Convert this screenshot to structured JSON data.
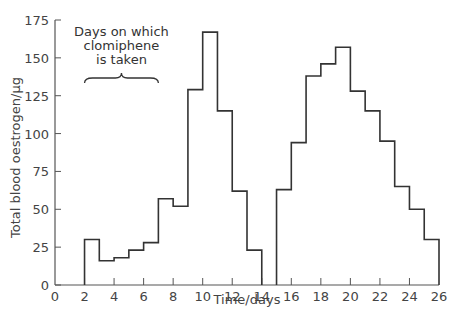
{
  "chart_data": {
    "type": "line",
    "subtype": "step",
    "title": "",
    "xlabel": "Time/days",
    "ylabel": "Total blood oestrogen/µg",
    "xlim": [
      0,
      26
    ],
    "ylim": [
      0,
      175
    ],
    "xticks": [
      0,
      2,
      4,
      6,
      8,
      10,
      12,
      14,
      16,
      18,
      20,
      22,
      24,
      26
    ],
    "yticks": [
      0,
      25,
      50,
      75,
      100,
      125,
      150,
      175
    ],
    "grid": false,
    "legend": null,
    "series": [
      {
        "name": "Total blood oestrogen (segment 1)",
        "x_start": [
          2,
          3,
          4,
          5,
          6,
          7,
          8,
          9,
          10,
          11,
          12,
          13
        ],
        "x_end": [
          3,
          4,
          5,
          6,
          7,
          8,
          9,
          10,
          11,
          12,
          13,
          14
        ],
        "values": [
          30,
          16,
          18,
          23,
          28,
          57,
          52,
          129,
          167,
          115,
          62,
          23
        ]
      },
      {
        "name": "Total blood oestrogen (segment 2)",
        "x_start": [
          15,
          16,
          17,
          18,
          19,
          20,
          21,
          22,
          23,
          24,
          25
        ],
        "x_end": [
          16,
          17,
          18,
          19,
          20,
          21,
          22,
          23,
          24,
          25,
          26
        ],
        "values": [
          63,
          94,
          138,
          146,
          157,
          128,
          115,
          95,
          65,
          50,
          30
        ]
      }
    ],
    "annotations": [
      {
        "text_lines": [
          "Days on which",
          "clomiphene",
          "is taken"
        ],
        "x_range": [
          2,
          7
        ],
        "marker": "curly-brace"
      }
    ]
  }
}
